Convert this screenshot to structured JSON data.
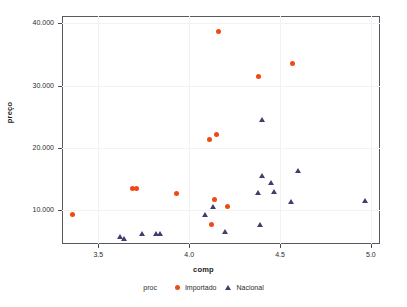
{
  "chart_data": {
    "type": "scatter",
    "title": "",
    "xlabel": "comp",
    "ylabel": "preço",
    "xlim": [
      3.3,
      5.05
    ],
    "ylim": [
      4600,
      41200
    ],
    "grid": true,
    "xticks": [
      3.5,
      4.0,
      4.5,
      5.0
    ],
    "xticklabels": [
      "3.5",
      "4.0",
      "4.5",
      "5.0"
    ],
    "yticks": [
      10000,
      20000,
      30000,
      40000
    ],
    "yticklabels": [
      "10.000",
      "20.000",
      "30.000",
      "40.000"
    ],
    "legend": {
      "title": "proc",
      "position": "bottom",
      "entries": [
        {
          "label": "Importado",
          "marker": "circle",
          "color": "#ef4a16"
        },
        {
          "label": "Nacional",
          "marker": "triangle",
          "color": "#3f3f6e"
        }
      ]
    },
    "series": [
      {
        "name": "Importado",
        "marker": "circle",
        "color": "#ef4a16",
        "points": [
          {
            "x": 3.36,
            "y": 9400
          },
          {
            "x": 3.69,
            "y": 13550
          },
          {
            "x": 3.71,
            "y": 13500
          },
          {
            "x": 3.93,
            "y": 12700
          },
          {
            "x": 4.11,
            "y": 21300
          },
          {
            "x": 4.15,
            "y": 22100
          },
          {
            "x": 4.16,
            "y": 38700
          },
          {
            "x": 4.14,
            "y": 11800
          },
          {
            "x": 4.12,
            "y": 7700
          },
          {
            "x": 4.21,
            "y": 10600
          },
          {
            "x": 4.38,
            "y": 31500
          },
          {
            "x": 4.57,
            "y": 33600
          }
        ]
      },
      {
        "name": "Nacional",
        "marker": "triangle",
        "color": "#3f3f6e",
        "points": [
          {
            "x": 3.62,
            "y": 5800
          },
          {
            "x": 3.64,
            "y": 5400
          },
          {
            "x": 3.74,
            "y": 6200
          },
          {
            "x": 3.82,
            "y": 6150
          },
          {
            "x": 3.84,
            "y": 6150
          },
          {
            "x": 4.09,
            "y": 9200
          },
          {
            "x": 4.13,
            "y": 10600
          },
          {
            "x": 4.2,
            "y": 6600
          },
          {
            "x": 4.38,
            "y": 12800
          },
          {
            "x": 4.4,
            "y": 15500
          },
          {
            "x": 4.4,
            "y": 24600
          },
          {
            "x": 4.39,
            "y": 7700
          },
          {
            "x": 4.45,
            "y": 14400
          },
          {
            "x": 4.47,
            "y": 13000
          },
          {
            "x": 4.56,
            "y": 11300
          },
          {
            "x": 4.6,
            "y": 16300
          },
          {
            "x": 4.97,
            "y": 11500
          }
        ]
      }
    ]
  }
}
